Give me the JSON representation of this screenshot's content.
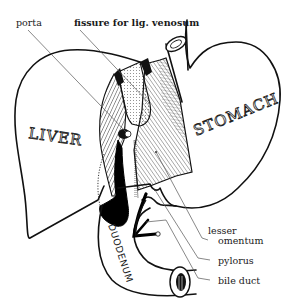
{
  "diagram": {
    "organs": {
      "liver": "LIVER",
      "stomach": "STOMACH",
      "duodenum": "DUODENUM"
    },
    "labels": {
      "porta": "porta",
      "fissure": "fissure for lig. venosum",
      "lesser_1": "lesser",
      "lesser_2": "omentum",
      "pylorus": "pylorus",
      "bile_duct": "bile duct"
    },
    "colors": {
      "line": "#111111",
      "background": "#ffffff",
      "fill_black": "#000000"
    }
  }
}
